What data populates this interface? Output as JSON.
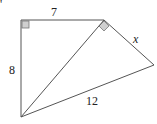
{
  "figure": {
    "type": "geometry",
    "fragment_mark": "'",
    "labels": {
      "top": "7",
      "left": "8",
      "right_upper": "x",
      "bottom": "12"
    },
    "right_angles": [
      "top-left vertex",
      "top-right vertex"
    ]
  }
}
